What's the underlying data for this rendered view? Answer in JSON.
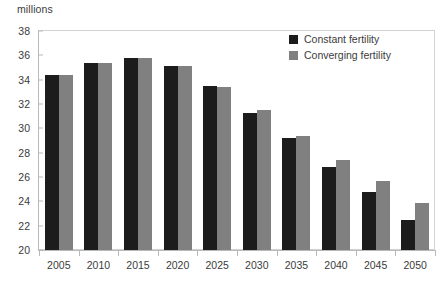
{
  "chart_data": {
    "type": "bar",
    "title": "",
    "subtitle": "",
    "xlabel": "",
    "ylabel": "millions",
    "unit_label": "millions",
    "categories": [
      "2005",
      "2010",
      "2015",
      "2020",
      "2025",
      "2030",
      "2035",
      "2040",
      "2045",
      "2050"
    ],
    "series": [
      {
        "name": "Constant fertility",
        "color": "#1c1c1c",
        "values": [
          34.4,
          35.4,
          35.8,
          35.1,
          33.5,
          31.3,
          29.2,
          26.8,
          24.8,
          22.5
        ]
      },
      {
        "name": "Converging fertility",
        "color": "#808080",
        "values": [
          34.4,
          35.4,
          35.8,
          35.1,
          33.4,
          31.5,
          29.4,
          27.4,
          25.7,
          23.9
        ]
      }
    ],
    "ylim": [
      20,
      38
    ],
    "ytick_step": 2,
    "yticks": [
      20,
      22,
      24,
      26,
      28,
      30,
      32,
      34,
      36,
      38
    ],
    "ytick_labels": [
      "20",
      "22",
      "24",
      "26",
      "28",
      "30",
      "32",
      "34",
      "36",
      "38"
    ],
    "grid": false,
    "legend_position": "top-right",
    "legend": [
      {
        "label": "Constant fertility",
        "color": "#1c1c1c"
      },
      {
        "label": "Converging fertility",
        "color": "#808080"
      }
    ],
    "colors": {
      "constant_fertility": "#1c1c1c",
      "converging_fertility": "#808080",
      "axis": "#b9b9b9",
      "plot_border": "#d2d2d2",
      "text": "#3b3b3b",
      "background": "#ffffff"
    }
  }
}
